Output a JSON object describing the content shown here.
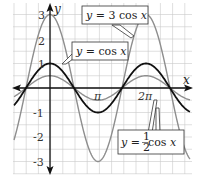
{
  "chart_data": {
    "type": "line",
    "title": "",
    "xlabel": "x",
    "ylabel": "y",
    "xlim": [
      -3.3,
      8.8
    ],
    "ylim": [
      -3.6,
      3.5
    ],
    "grid": true,
    "x_tick_labels": [
      "π",
      "2π"
    ],
    "x_tick_values": [
      3.14159,
      6.28318
    ],
    "y_tick_labels": [
      "3",
      "2",
      "1",
      "-1",
      "-2",
      "-3"
    ],
    "y_tick_values": [
      3,
      2,
      1,
      -1,
      -2,
      -3
    ],
    "series": [
      {
        "name": "y = 3 cos x",
        "function": "3*cos(x)",
        "color": "#8a8a8a",
        "amplitude": 3
      },
      {
        "name": "y = cos x",
        "function": "cos(x)",
        "color": "#111111",
        "amplitude": 1
      },
      {
        "name": "y = 1/2 cos x",
        "function": "0.5*cos(x)",
        "color": "#8a8a8a",
        "amplitude": 0.5
      }
    ],
    "annotations": [
      {
        "text": "y = 3 cos x",
        "points_to": "y = 3 cos x near x = 2π"
      },
      {
        "text": "y = cos x",
        "points_to": "y = cos x near x = -π/2"
      },
      {
        "text": "y = 1/2 cos x",
        "points_to": "y = 1/2 cos x near x = 2π"
      }
    ]
  },
  "axes": {
    "x_label": "x",
    "y_label": "y",
    "x_ticks": [
      "π",
      "2π"
    ],
    "y_ticks": [
      "3",
      "2",
      "1",
      "-1",
      "-2",
      "-3"
    ]
  },
  "legend": {
    "three_cos": {
      "prefix": "y",
      "eq": " = 3 cos ",
      "var": "x"
    },
    "cos": {
      "prefix": "y",
      "eq": " = cos ",
      "var": "x"
    },
    "half_cos": {
      "prefix": "y",
      "eq": " = ",
      "num": "1",
      "den": "2",
      "cos": " cos ",
      "var": "x"
    }
  }
}
